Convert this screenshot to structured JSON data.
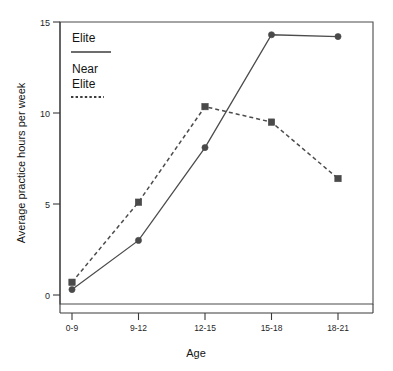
{
  "chart_data": {
    "type": "line",
    "title": "",
    "xlabel": "Age",
    "ylabel": "Average practice hours per week",
    "categories": [
      "0-9",
      "9-12",
      "12-15",
      "15-18",
      "18-21"
    ],
    "yticks": [
      "0",
      "5",
      "10",
      "15"
    ],
    "ytick_values": [
      0,
      5,
      10,
      15
    ],
    "ylim": [
      0,
      15
    ],
    "grid": false,
    "legend_position": "top-left inside plot",
    "series": [
      {
        "name": "Elite",
        "values": [
          0.3,
          3.0,
          8.1,
          14.3,
          14.2
        ],
        "line_style": "solid",
        "marker": "circle",
        "color": "#4c4c4c"
      },
      {
        "name": "Near Elite",
        "values": [
          0.7,
          5.1,
          10.35,
          9.5,
          6.4
        ],
        "line_style": "dashed",
        "marker": "square",
        "color": "#4c4c4c"
      }
    ]
  },
  "legend": {
    "entries": [
      {
        "label_line1": "Elite",
        "label_line2": ""
      },
      {
        "label_line1": "Near",
        "label_line2": "Elite"
      }
    ]
  },
  "colors": {
    "ink": "#1a1a1a",
    "line": "#4c4c4c",
    "axis": "#3a3a3a",
    "background": "#ffffff"
  }
}
